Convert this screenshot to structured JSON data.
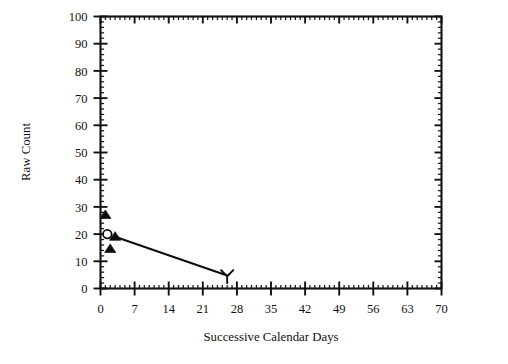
{
  "chart_data": {
    "type": "scatter",
    "title": "",
    "xlabel": "Successive Calendar Days",
    "ylabel": "Raw Count",
    "xlim": [
      0,
      70
    ],
    "ylim": [
      0,
      100
    ],
    "grid": false,
    "legend": "none",
    "frame": "box",
    "tick_direction": "in",
    "x_ticks": [
      0,
      7,
      14,
      21,
      28,
      35,
      42,
      49,
      56,
      63,
      70
    ],
    "x_tick_labels": [
      "0",
      "7",
      "14",
      "21",
      "28",
      "35",
      "42",
      "49",
      "56",
      "63",
      "70"
    ],
    "x_minor_step": 1,
    "y_ticks": [
      0,
      10,
      20,
      30,
      40,
      50,
      60,
      70,
      80,
      90,
      100
    ],
    "y_tick_labels": [
      "0",
      "10",
      "20",
      "30",
      "40",
      "50",
      "60",
      "70",
      "80",
      "90",
      "100"
    ],
    "y_minor_step": 2,
    "series": [
      {
        "name": "observations-filled-triangle",
        "marker": "triangle-up-filled",
        "points": [
          {
            "x": 1.0,
            "y": 27.0
          },
          {
            "x": 3.0,
            "y": 19.0
          },
          {
            "x": 2.0,
            "y": 14.5
          }
        ]
      },
      {
        "name": "observation-open-circle",
        "marker": "circle-open",
        "points": [
          {
            "x": 1.4,
            "y": 20.0
          }
        ]
      },
      {
        "name": "observation-wye",
        "marker": "wye",
        "points": [
          {
            "x": 26.0,
            "y": 4.5
          }
        ]
      }
    ],
    "annotations": [
      {
        "name": "trend-line",
        "type": "line-segment",
        "from": {
          "x": 3.0,
          "y": 19.0
        },
        "to": {
          "x": 26.0,
          "y": 4.8
        }
      }
    ]
  },
  "colors": {
    "ink": "#0d0d0d",
    "axis": "#111111",
    "background": "#ffffff"
  }
}
